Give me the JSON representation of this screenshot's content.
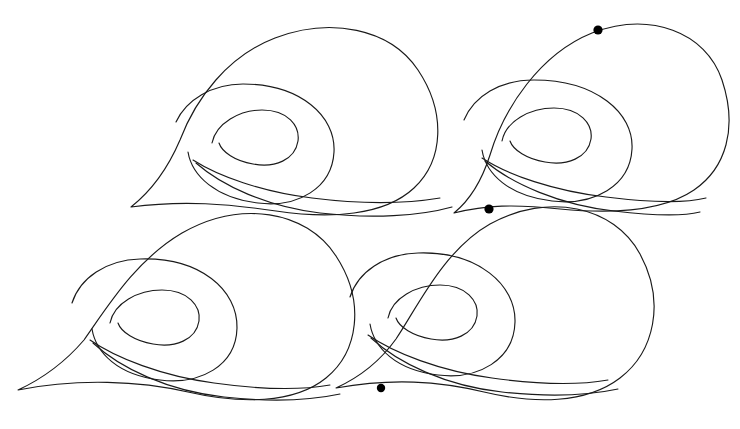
{
  "canvas": {
    "width": 740,
    "height": 429,
    "background_color": "#ffffff",
    "title": "Wave Spiral Line Art"
  },
  "style": {
    "stroke_color": "#1a1a1a",
    "stroke_width": 1.15,
    "fill": "none",
    "marker_color": "#000000"
  },
  "motifs": [
    {
      "id": "motif-top-left",
      "name": "wave-spiral-top-left",
      "center": {
        "x": 263,
        "y": 118
      },
      "crest": "M 131 207 C 150 192 168 168 180 140 C 196 98 228 56 275 38 C 330 17 390 28 418 70 C 446 112 444 160 414 188 C 384 216 330 219 276 211 C 228 204 184 200 131 207 Z",
      "outer_spiral": "M 176 122 C 186 100 212 84 243 84 C 300 84 336 116 334 152 C 332 188 298 208 258 203 C 216 198 192 176 188 152",
      "inner_spiral": "M 212 143 C 216 123 240 110 262 110 C 288 110 300 126 298 141 C 295 160 275 168 253 164 C 235 161 222 152 219 143",
      "tail_upper": "M 193 160 C 218 176 262 192 312 198 C 360 204 404 204 440 198",
      "tail_lower": "M 196 163 C 222 186 268 207 320 213 C 372 219 420 216 452 207"
    },
    {
      "id": "motif-top-right",
      "name": "wave-spiral-top-right",
      "center": {
        "x": 562,
        "y": 110
      },
      "crest": "M 454 213 C 470 200 482 180 490 155 C 504 108 540 54 592 33 C 650 11 706 32 722 80 C 738 128 726 168 694 190 C 662 212 612 214 560 209 C 514 204 486 205 454 213 Z",
      "outer_spiral": "M 464 120 C 474 96 500 80 534 80 C 596 80 634 113 632 149 C 630 186 594 206 552 201 C 509 196 486 174 482 150",
      "inner_spiral": "M 502 141 C 506 121 530 108 554 108 C 580 108 593 124 591 139 C 588 158 567 166 545 162 C 527 159 513 150 510 141",
      "tail_upper": "M 482 158 C 508 175 554 191 606 197 C 654 203 686 203 706 198",
      "tail_lower": "M 485 161 C 512 184 560 205 614 211 C 664 217 688 215 700 212"
    },
    {
      "id": "motif-bottom-left",
      "name": "wave-spiral-bottom-left",
      "center": {
        "x": 198,
        "y": 305
      },
      "crest": "M 18 390 C 44 378 66 361 84 340 C 108 306 136 260 182 233 C 240 200 306 210 336 256 C 366 302 358 352 326 378 C 294 404 240 404 188 392 C 140 381 78 378 18 390 Z",
      "outer_spiral": "M 72 303 C 80 278 106 260 140 259 C 200 257 238 290 237 328 C 236 366 200 385 160 380 C 118 375 96 353 92 329",
      "inner_spiral": "M 110 323 C 114 303 138 290 162 290 C 188 290 201 306 199 321 C 196 340 175 348 153 344 C 135 341 121 332 118 323",
      "tail_upper": "M 90 340 C 116 358 162 376 214 383 C 264 390 302 390 330 385",
      "tail_lower": "M 93 343 C 120 368 168 391 224 397 C 278 403 312 400 340 394"
    },
    {
      "id": "motif-bottom-right",
      "name": "wave-spiral-bottom-right",
      "center": {
        "x": 500,
        "y": 300
      },
      "crest": "M 336 388 C 360 377 381 360 396 339 C 418 306 444 250 490 224 C 548 192 614 206 640 254 C 666 302 654 352 620 378 C 586 404 534 404 484 392 C 438 381 392 378 336 388 Z",
      "outer_spiral": "M 350 297 C 358 272 384 254 418 253 C 478 251 516 285 515 322 C 514 360 478 380 438 375 C 396 370 374 348 370 324",
      "inner_spiral": "M 388 318 C 392 298 416 285 440 285 C 466 285 479 301 477 316 C 474 335 453 343 431 339 C 413 336 399 327 396 318",
      "tail_upper": "M 368 335 C 394 353 440 371 492 378 C 542 385 580 385 608 380",
      "tail_lower": "M 371 338 C 398 363 446 386 502 392 C 556 398 590 395 618 389"
    }
  ],
  "markers": [
    {
      "id": "marker-1",
      "name": "dot-marker-top-right-crest",
      "x": 598,
      "y": 30,
      "radius": 4.6,
      "color": "#000000",
      "on_curve": "motif-top-right.crest"
    },
    {
      "id": "marker-2",
      "name": "dot-marker-bottom-right-crest",
      "x": 489,
      "y": 209,
      "radius": 4.6,
      "color": "#000000",
      "on_curve": "motif-bottom-right.crest"
    },
    {
      "id": "marker-3",
      "name": "dot-marker-free-floating",
      "x": 381,
      "y": 388,
      "radius": 4.2,
      "color": "#000000",
      "on_curve": "none"
    }
  ]
}
